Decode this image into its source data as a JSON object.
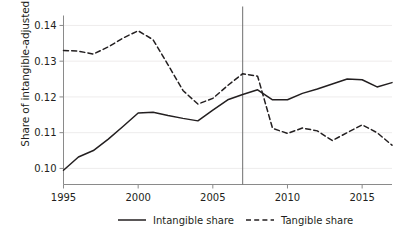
{
  "chart_data": {
    "type": "line",
    "title": "",
    "xlabel": "",
    "ylabel": "Share of intangible-adjusted GDP",
    "xlim": [
      1995,
      2017
    ],
    "ylim": [
      0.0955,
      0.1425
    ],
    "grid": true,
    "grid_axis": "y",
    "legend_position": "bottom",
    "xticks": [
      1995,
      2000,
      2005,
      2010,
      2015
    ],
    "xtick_labels": [
      "1995",
      "2000",
      "2005",
      "2010",
      "2015"
    ],
    "yticks": [
      0.1,
      0.11,
      0.12,
      0.13,
      0.14
    ],
    "ytick_labels": [
      "0.10",
      "0.11",
      "0.12",
      "0.13",
      "0.14"
    ],
    "x": [
      1995,
      1996,
      1997,
      1998,
      1999,
      2000,
      2001,
      2002,
      2003,
      2004,
      2005,
      2006,
      2007,
      2008,
      2009,
      2010,
      2011,
      2012,
      2013,
      2014,
      2015,
      2016,
      2017
    ],
    "annotations": [
      {
        "type": "vline",
        "x": 2007,
        "label": "",
        "color": "#6e6e6e"
      }
    ],
    "series": [
      {
        "name": "Intangible share",
        "style": "solid",
        "color": "#231f20",
        "values": [
          0.0995,
          0.1032,
          0.105,
          0.1082,
          0.1118,
          0.1155,
          0.1157,
          0.1148,
          0.114,
          0.1133,
          0.1163,
          0.1192,
          0.1207,
          0.122,
          0.1192,
          0.1192,
          0.121,
          0.1222,
          0.1236,
          0.125,
          0.1248,
          0.1228,
          0.124
        ]
      },
      {
        "name": "Tangible share",
        "style": "dashed",
        "color": "#231f20",
        "values": [
          0.133,
          0.1328,
          0.132,
          0.134,
          0.1365,
          0.1385,
          0.136,
          0.129,
          0.1218,
          0.118,
          0.1196,
          0.1232,
          0.1265,
          0.1258,
          0.1112,
          0.1098,
          0.1113,
          0.1105,
          0.1078,
          0.11,
          0.1122,
          0.11,
          0.1065
        ]
      }
    ]
  },
  "legend": {
    "items": [
      {
        "label": "Intangible share",
        "style": "solid"
      },
      {
        "label": "Tangible share",
        "style": "dashed"
      }
    ]
  }
}
